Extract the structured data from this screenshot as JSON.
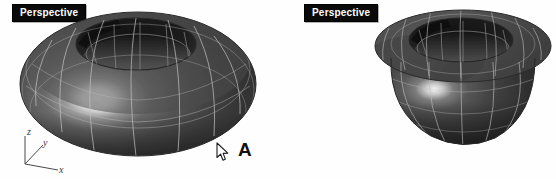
{
  "app": {
    "background_color": "#fefefe",
    "surface_color": "#4a4a4a",
    "wireframe_color": "#b9b9b9",
    "title_bg_color": "#0a0a0a",
    "title_text_color": "#ffffff",
    "annotation_color": "#111111"
  },
  "viewports": [
    {
      "id": "left",
      "title": "Perspective",
      "gizmo": {
        "z_label": "z",
        "y_label": "y",
        "x_label": "x"
      },
      "object": {
        "name": "torus-surface",
        "description": "Donut shaped torus surface with wireframe isocurves",
        "shading": "shaded",
        "has_specular_highlight": true
      },
      "cursor": {
        "name": "arrow-cursor",
        "visible": true
      },
      "annotation": {
        "label": "A"
      }
    },
    {
      "id": "right",
      "title": "Perspective",
      "gizmo": {
        "z_label": "z",
        "y_label": "y",
        "x_label": "x"
      },
      "object": {
        "name": "self-intersecting-torus-surface",
        "description": "Pinched torus surface with flat flange rim and bowl shaped lower body",
        "shading": "shaded",
        "has_specular_highlight": true
      },
      "cursor": {
        "name": "arrow-cursor",
        "visible": false
      },
      "annotation": {
        "label": ""
      }
    }
  ]
}
